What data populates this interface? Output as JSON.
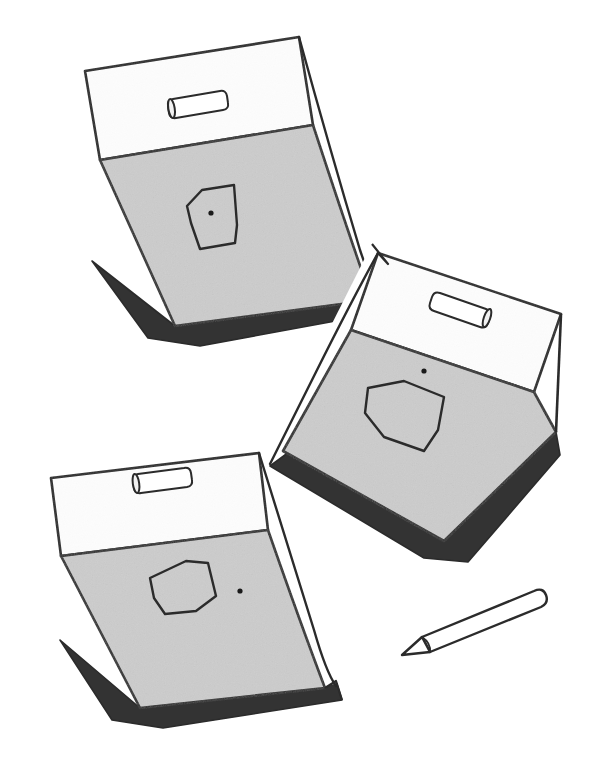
{
  "illustration": {
    "title": "Three clipboard notepads with drawn squares and a pencil",
    "background_color": "#ffffff",
    "stroke_color": "#2b2b2b",
    "paper_gray": "#cccccc",
    "header_white": "#fdfdfd",
    "backing_dark": "#333333",
    "dot_color": "#1a1a1a",
    "objects": [
      {
        "name": "notepad-1",
        "label": "Notepad top-left",
        "rotation_deg": -13,
        "has_handle": true,
        "has_curled_page": true,
        "square_label": "hand-drawn square",
        "dot_position": "center-of-square"
      },
      {
        "name": "notepad-2",
        "label": "Notepad middle-right",
        "rotation_deg": -22,
        "has_handle": true,
        "has_curled_page": true,
        "square_label": "hand-drawn square",
        "dot_position": "above-right-of-square"
      },
      {
        "name": "notepad-3",
        "label": "Notepad bottom-left",
        "rotation_deg": -11,
        "has_handle": true,
        "has_curled_page": true,
        "square_label": "hand-drawn square",
        "dot_position": "right-of-square"
      },
      {
        "name": "pencil",
        "label": "Pencil pointing down-left",
        "rotation_deg": 28,
        "tip": "sharpened"
      }
    ]
  },
  "canvas": {
    "width": 607,
    "height": 772
  }
}
